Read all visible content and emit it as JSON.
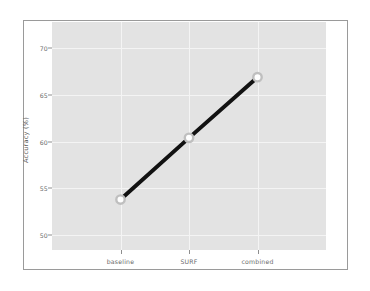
{
  "chart_data": {
    "type": "line",
    "title": "",
    "xlabel": "",
    "ylabel": "Accuracy (%)",
    "categories": [
      "baseline",
      "SURF",
      "combined"
    ],
    "values": [
      53.8,
      60.4,
      66.9
    ],
    "series": [
      {
        "name": "Accuracy",
        "values": [
          53.8,
          60.4,
          66.9
        ]
      }
    ],
    "yticks": [
      50,
      55,
      60,
      65,
      70
    ],
    "ytick_labels": [
      "50",
      "55",
      "60",
      "65",
      "70"
    ],
    "ylim": [
      48.4,
      72.8
    ],
    "xtick_labels": [
      "baseline",
      "SURF",
      "combined"
    ],
    "grid": true,
    "legend": false,
    "legend_position": "none",
    "style": {
      "line_color": "#121212",
      "line_width": 4,
      "marker": "circle",
      "marker_face_color": "#ffffff",
      "marker_edge_color": "#bfbfbf",
      "plot_background": "#e3e3e3",
      "figure_background": "#ffffff",
      "grid_color": "#f4f4f4",
      "frame_color": "#9a9a9a",
      "tick_label_color": "#6b6b6b",
      "axis_label_color": "#5e5e5e"
    }
  }
}
